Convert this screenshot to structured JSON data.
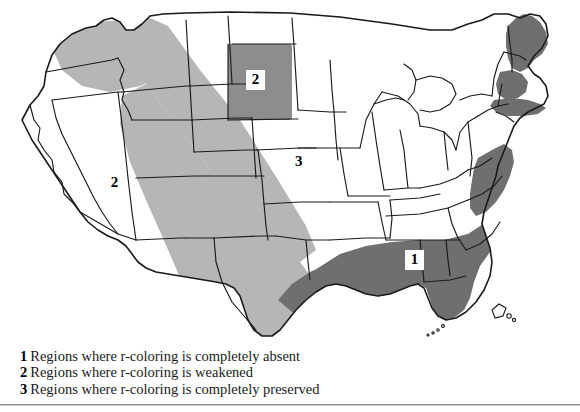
{
  "figure": {
    "kind": "thematic-map",
    "background_color": "#ffffff",
    "outline_color": "#1a1a1a"
  },
  "map": {
    "shading": {
      "dark_gray": "#6f6f6f",
      "light_gray": "#b6b6b6",
      "white": "#ffffff"
    },
    "labels": [
      {
        "id": "label-2-dakota",
        "text": "2",
        "boxed": true,
        "x": 246,
        "y": 70,
        "region": "northern-plains-dakotas"
      },
      {
        "id": "label-2-west",
        "text": "2",
        "boxed": true,
        "x": 105,
        "y": 173,
        "region": "interior-west-band"
      },
      {
        "id": "label-1-south",
        "text": "1",
        "boxed": true,
        "x": 405,
        "y": 250,
        "region": "deep-south-gulf"
      },
      {
        "id": "label-3-central",
        "text": "3",
        "boxed": false,
        "x": 295,
        "y": 153,
        "region": "midland-central"
      }
    ]
  },
  "legend": {
    "entries": [
      {
        "key": "1",
        "text": "Regions where r-coloring is completely absent"
      },
      {
        "key": "2",
        "text": "Regions where r-coloring is weakened"
      },
      {
        "key": "3",
        "text": "Regions where r-coloring is completely preserved"
      }
    ]
  }
}
